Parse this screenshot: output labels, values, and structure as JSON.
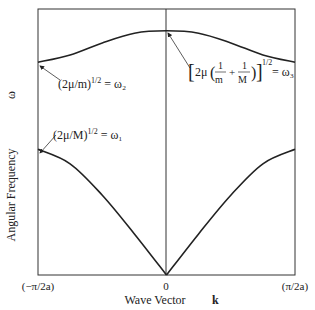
{
  "chart_data": {
    "type": "line",
    "title": "",
    "xlabel": "Wave Vector",
    "xlabel_symbol": "k",
    "ylabel": "Angular Frequency",
    "ylabel_symbol": "ω",
    "x_ticks": [
      "(−π/2a)",
      "0",
      "(π/2a)"
    ],
    "xlim": [
      -1,
      1
    ],
    "ylim": [
      0,
      1.1
    ],
    "grid": false,
    "series": [
      {
        "name": "optical",
        "x": [
          -1,
          -0.75,
          -0.5,
          -0.25,
          0,
          0.25,
          0.5,
          0.75,
          1
        ],
        "y": [
          0.88,
          0.91,
          0.96,
          1.0,
          1.01,
          1.0,
          0.96,
          0.91,
          0.88
        ]
      },
      {
        "name": "acoustic",
        "x": [
          -1,
          -0.75,
          -0.5,
          -0.25,
          0,
          0.25,
          0.5,
          0.75,
          1
        ],
        "y": [
          0.52,
          0.46,
          0.33,
          0.17,
          0,
          0.17,
          0.33,
          0.46,
          0.52
        ]
      }
    ],
    "annotations": [
      {
        "text": "(2μ/m)^1/2 = ω₂",
        "parts": [
          "(2μ/m)",
          "1/2",
          " = ω₂"
        ],
        "points_to": "optical at k = −π/2a"
      },
      {
        "text": "(2μ/M)^1/2 = ω₁",
        "parts": [
          "(2μ/M)",
          "1/2",
          " = ω₁"
        ],
        "points_to": "acoustic at k = −π/2a"
      },
      {
        "text": "[2μ(1/m + 1/M)]^1/2 = ω₃",
        "parts": [
          "2μ",
          "1",
          "m",
          "+",
          "1",
          "M",
          "1/2",
          "= ω₃"
        ],
        "points_to": "optical at k = 0"
      }
    ]
  }
}
